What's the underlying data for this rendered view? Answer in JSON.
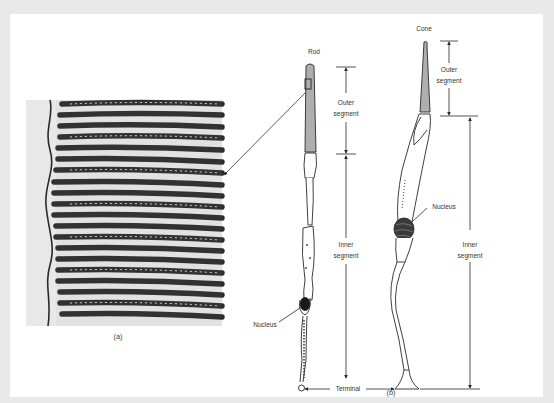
{
  "figure": {
    "panel_a": {
      "caption": "(a)",
      "description": "Electron micrograph of stacked outer-segment discs",
      "stripe_count": 20
    },
    "panel_b": {
      "caption": "(b)",
      "cells": {
        "rod": {
          "title": "Rod",
          "nucleus_label": "Nucleus"
        },
        "cone": {
          "title": "Cone",
          "nucleus_label": "Nucleus"
        }
      },
      "dimensions": {
        "rod_outer": {
          "line1": "Outer",
          "line2": "segment"
        },
        "rod_inner": {
          "line1": "Inner",
          "line2": "segment"
        },
        "cone_outer": {
          "line1": "Outer",
          "line2": "segment"
        },
        "cone_inner": {
          "line1": "Inner",
          "line2": "segment"
        }
      },
      "terminal_label": "Terminal"
    },
    "colors": {
      "background": "#e9e9e9",
      "panel": "#ffffff",
      "ink": "#2a2a2a"
    }
  }
}
